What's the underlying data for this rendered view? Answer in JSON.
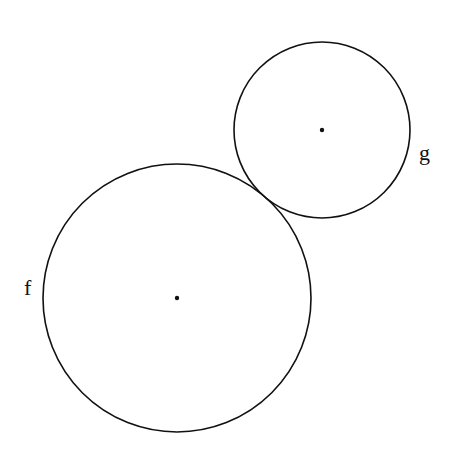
{
  "diagram": {
    "circles": [
      {
        "name": "f",
        "label": "f",
        "cx": 177,
        "cy": 298,
        "r": 134
      },
      {
        "name": "g",
        "label": "g",
        "cx": 322,
        "cy": 130,
        "r": 88
      }
    ],
    "stroke_color": "#111111",
    "background": "#ffffff"
  }
}
